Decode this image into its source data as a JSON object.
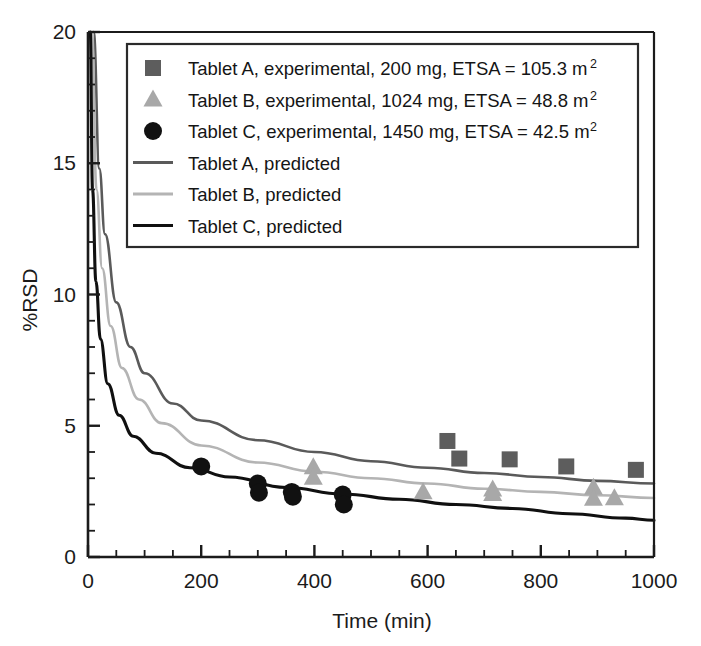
{
  "chart_data": {
    "type": "scatter",
    "title": "",
    "xlabel": "Time (min)",
    "ylabel": "%RSD",
    "xlim": [
      0,
      1000
    ],
    "ylim": [
      0,
      20
    ],
    "grid": false,
    "legend_position": "top-center",
    "x_ticks": [
      0,
      200,
      400,
      600,
      800,
      1000
    ],
    "x_tick_labels": [
      "0",
      "200",
      "400",
      "600",
      "800",
      "1000"
    ],
    "x_minor_step": 50,
    "y_ticks": [
      0,
      5,
      10,
      15,
      20
    ],
    "y_tick_labels": [
      "0",
      "5",
      "10",
      "15",
      "20"
    ],
    "y_minor_step": 1,
    "series": [
      {
        "name": "Tablet A, experimental, 200 mg, ETSA = 105.3 m2",
        "legend_label_text": "Tablet A, experimental, 200 mg, ETSA = 105.3 m",
        "legend_label_sup": "2",
        "kind": "scatter",
        "marker": "square",
        "color": "#5d5d5d",
        "points": [
          {
            "x": 635,
            "y": 4.42
          },
          {
            "x": 656,
            "y": 3.75
          },
          {
            "x": 745,
            "y": 3.72
          },
          {
            "x": 845,
            "y": 3.45
          },
          {
            "x": 968,
            "y": 3.32
          }
        ]
      },
      {
        "name": "Tablet B, experimental, 1024 mg, ETSA = 48.8 m2",
        "legend_label_text": "Tablet B, experimental, 1024 mg, ETSA = 48.8 m",
        "legend_label_sup": "2",
        "kind": "scatter",
        "marker": "triangle",
        "color": "#a8a8a8",
        "points": [
          {
            "x": 398,
            "y": 3.4
          },
          {
            "x": 398,
            "y": 3.0
          },
          {
            "x": 592,
            "y": 2.45
          },
          {
            "x": 715,
            "y": 2.55
          },
          {
            "x": 715,
            "y": 2.38
          },
          {
            "x": 893,
            "y": 2.62
          },
          {
            "x": 893,
            "y": 2.2
          },
          {
            "x": 930,
            "y": 2.22
          }
        ]
      },
      {
        "name": "Tablet C, experimental, 1450 mg, ETSA = 42.5 m2",
        "legend_label_text": "Tablet C, experimental, 1450 mg, ETSA = 42.5 m",
        "legend_label_sup": "2",
        "kind": "scatter",
        "marker": "circle",
        "color": "#111111",
        "points": [
          {
            "x": 200,
            "y": 3.45
          },
          {
            "x": 300,
            "y": 2.8
          },
          {
            "x": 302,
            "y": 2.45
          },
          {
            "x": 360,
            "y": 2.48
          },
          {
            "x": 362,
            "y": 2.3
          },
          {
            "x": 450,
            "y": 2.38
          },
          {
            "x": 452,
            "y": 2.0
          }
        ]
      },
      {
        "name": "Tablet A, predicted",
        "legend_label_text": "Tablet A, predicted",
        "legend_label_sup": "",
        "kind": "line",
        "color": "#5a5a5a",
        "model": "power",
        "curve": [
          {
            "x": 10,
            "y": 20.0
          },
          {
            "x": 20,
            "y": 14.8
          },
          {
            "x": 30,
            "y": 12.3
          },
          {
            "x": 50,
            "y": 9.7
          },
          {
            "x": 75,
            "y": 8.0
          },
          {
            "x": 100,
            "y": 7.0
          },
          {
            "x": 150,
            "y": 5.85
          },
          {
            "x": 200,
            "y": 5.2
          },
          {
            "x": 300,
            "y": 4.45
          },
          {
            "x": 400,
            "y": 4.0
          },
          {
            "x": 500,
            "y": 3.65
          },
          {
            "x": 600,
            "y": 3.4
          },
          {
            "x": 700,
            "y": 3.2
          },
          {
            "x": 800,
            "y": 3.05
          },
          {
            "x": 900,
            "y": 2.9
          },
          {
            "x": 1000,
            "y": 2.8
          }
        ]
      },
      {
        "name": "Tablet B, predicted",
        "legend_label_text": "Tablet B, predicted",
        "legend_label_sup": "",
        "kind": "line",
        "color": "#b4b4b4",
        "model": "power",
        "curve": [
          {
            "x": 7,
            "y": 20.0
          },
          {
            "x": 15,
            "y": 14.0
          },
          {
            "x": 25,
            "y": 11.0
          },
          {
            "x": 40,
            "y": 8.8
          },
          {
            "x": 60,
            "y": 7.2
          },
          {
            "x": 90,
            "y": 6.0
          },
          {
            "x": 130,
            "y": 5.1
          },
          {
            "x": 200,
            "y": 4.25
          },
          {
            "x": 300,
            "y": 3.6
          },
          {
            "x": 400,
            "y": 3.25
          },
          {
            "x": 500,
            "y": 3.0
          },
          {
            "x": 600,
            "y": 2.8
          },
          {
            "x": 700,
            "y": 2.6
          },
          {
            "x": 800,
            "y": 2.48
          },
          {
            "x": 900,
            "y": 2.35
          },
          {
            "x": 1000,
            "y": 2.25
          }
        ]
      },
      {
        "name": "Tablet C, predicted",
        "legend_label_text": "Tablet C, predicted",
        "legend_label_sup": "",
        "kind": "line",
        "color": "#101010",
        "model": "power",
        "curve": [
          {
            "x": 4,
            "y": 20.0
          },
          {
            "x": 8,
            "y": 14.0
          },
          {
            "x": 14,
            "y": 10.5
          },
          {
            "x": 22,
            "y": 8.3
          },
          {
            "x": 35,
            "y": 6.6
          },
          {
            "x": 55,
            "y": 5.4
          },
          {
            "x": 80,
            "y": 4.6
          },
          {
            "x": 120,
            "y": 3.95
          },
          {
            "x": 180,
            "y": 3.4
          },
          {
            "x": 250,
            "y": 3.05
          },
          {
            "x": 350,
            "y": 2.65
          },
          {
            "x": 450,
            "y": 2.4
          },
          {
            "x": 550,
            "y": 2.2
          },
          {
            "x": 650,
            "y": 2.0
          },
          {
            "x": 750,
            "y": 1.85
          },
          {
            "x": 850,
            "y": 1.65
          },
          {
            "x": 950,
            "y": 1.48
          },
          {
            "x": 1000,
            "y": 1.4
          }
        ]
      }
    ]
  },
  "axes": {
    "frame_color": "#1b1b1b",
    "background": "#ffffff"
  },
  "legend": {
    "border_color": "#2a2a2a",
    "background": "#ffffff"
  }
}
